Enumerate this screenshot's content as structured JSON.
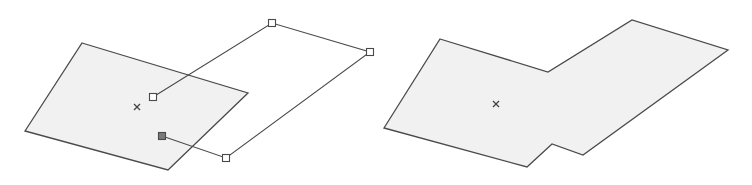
{
  "diagram": {
    "colors": {
      "fill": "#f1f1f1",
      "stroke": "#4a4a4a",
      "handle_fill": "#ffffff",
      "active_handle_fill": "#7a7a7a"
    },
    "before": {
      "shaded_polygon": [
        [
          82,
          43
        ],
        [
          248,
          93
        ],
        [
          168,
          170
        ],
        [
          25,
          131
        ]
      ],
      "center_marker": [
        137,
        107
      ],
      "outline_polygon": [
        [
          153,
          97
        ],
        [
          272,
          23
        ],
        [
          370,
          52
        ],
        [
          226,
          158
        ],
        [
          162,
          136
        ]
      ],
      "handles": [
        [
          153,
          97
        ],
        [
          272,
          23
        ],
        [
          370,
          52
        ],
        [
          226,
          158
        ]
      ],
      "active_handle": [
        162,
        136
      ]
    },
    "after": {
      "merged_polygon": [
        [
          440,
          39
        ],
        [
          548,
          72
        ],
        [
          632,
          20
        ],
        [
          728,
          50
        ],
        [
          583,
          155
        ],
        [
          552,
          144
        ],
        [
          527,
          167
        ],
        [
          384,
          128
        ]
      ],
      "center_marker": [
        496,
        104
      ]
    }
  }
}
